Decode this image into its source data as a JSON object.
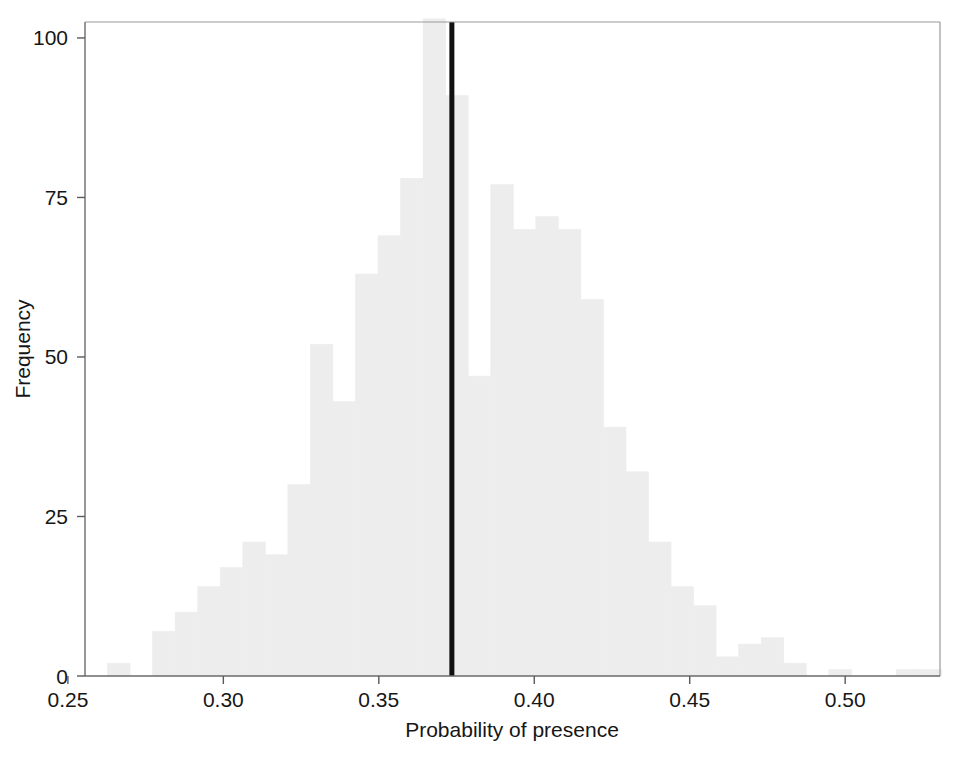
{
  "chart_data": {
    "type": "bar",
    "subtype": "histogram",
    "title": "",
    "xlabel": "Probability of presence",
    "ylabel": "Frequency",
    "xlim": [
      0.2555,
      0.5305
    ],
    "ylim": [
      0,
      102.5
    ],
    "xticks": [
      0.25,
      0.3,
      0.35,
      0.4,
      0.45,
      0.5
    ],
    "xtick_labels": [
      "0.25",
      "0.30",
      "0.35",
      "0.40",
      "0.45",
      "0.50"
    ],
    "yticks": [
      0,
      25,
      50,
      75,
      100
    ],
    "ytick_labels": [
      "0",
      "25",
      "50",
      "75",
      "100"
    ],
    "grid": false,
    "legend": null,
    "bar_color": "#ededed",
    "bar_edge_color": "#ededed",
    "axis_color": "#5a5a5a",
    "text_color": "#161616",
    "bin_width": 0.00725,
    "bin_starts": [
      0.2555,
      0.26275,
      0.27,
      0.27725,
      0.2845,
      0.29175,
      0.299,
      0.30625,
      0.3135,
      0.32075,
      0.328,
      0.33525,
      0.3425,
      0.34975,
      0.357,
      0.36425,
      0.3715,
      0.37875,
      0.386,
      0.39325,
      0.4005,
      0.40775,
      0.415,
      0.42225,
      0.4295,
      0.43675,
      0.444,
      0.45125,
      0.4585,
      0.46575,
      0.473,
      0.48025,
      0.4875,
      0.49475,
      0.502,
      0.50925,
      0.5165,
      0.52375
    ],
    "bin_centers": [
      0.2591,
      0.2664,
      0.2736,
      0.2809,
      0.2881,
      0.2954,
      0.3026,
      0.3099,
      0.3171,
      0.3244,
      0.3316,
      0.3389,
      0.3461,
      0.3534,
      0.3606,
      0.3679,
      0.3751,
      0.3824,
      0.3896,
      0.3969,
      0.4041,
      0.4114,
      0.4186,
      0.4259,
      0.4331,
      0.4404,
      0.4476,
      0.4549,
      0.4621,
      0.4694,
      0.4766,
      0.4839,
      0.4911,
      0.4984,
      0.5056,
      0.5129,
      0.5201,
      0.5274
    ],
    "values": [
      0,
      2,
      0,
      7,
      10,
      14,
      17,
      21,
      19,
      30,
      52,
      43,
      63,
      69,
      78,
      103,
      91,
      47,
      77,
      70,
      72,
      70,
      59,
      39,
      32,
      21,
      14,
      11,
      3,
      5,
      6,
      2,
      0,
      1,
      0,
      0,
      1,
      1
    ],
    "annotations": [
      {
        "type": "vline",
        "name": "observed-value-line",
        "x": 0.3735,
        "color": "#111111",
        "linewidth": 5
      }
    ]
  },
  "axes": {
    "xlabel": "Probability of presence",
    "ylabel": "Frequency"
  }
}
